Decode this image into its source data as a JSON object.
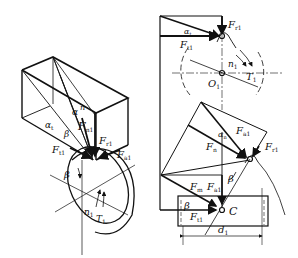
{
  "diagram": {
    "type": "helical gear force analysis",
    "left_view": {
      "labels": {
        "alpha_n": "α",
        "alpha_n_sub": "n",
        "n": "n",
        "alpha_t": "α",
        "alpha_t_sub": "t",
        "beta_top": "β",
        "Fn": "F",
        "Fn_sub": "n1",
        "Ft": "F",
        "Ft_sub": "t1",
        "Fr": "F",
        "Fr_sub": "r1",
        "Fa": "F",
        "Fa_sub": "a1",
        "beta_gear": "β",
        "n1": "n",
        "n1_sub": "1",
        "T1": "T",
        "T1_sub": "1"
      }
    },
    "right_top_view": {
      "labels": {
        "Fr": "F",
        "Fr_sub": "r1",
        "alpha_t": "α",
        "alpha_t_sub": "t",
        "Ft": "F",
        "Ft_sub": "t1",
        "n1": "n",
        "n1_sub": "1",
        "T1": "T",
        "T1_sub": "1",
        "O1": "O",
        "O1_sub": "1"
      }
    },
    "right_bottom_view": {
      "labels": {
        "alpha_n": "α",
        "alpha_n_sub": "n",
        "Fa": "F",
        "Fa_sub": "a1",
        "Fn": "F",
        "Fn_sub": "n",
        "Fr": "F",
        "Fr_sub": "r1",
        "beta_mid": "β",
        "Fn2": "F",
        "Fn2_sub": "m",
        "Fa2": "F",
        "Fa2_sub": "a1",
        "beta_low": "β",
        "Ft": "F",
        "Ft_sub": "t1",
        "C": "C",
        "d1": "d",
        "d1_sub": "1"
      }
    }
  }
}
